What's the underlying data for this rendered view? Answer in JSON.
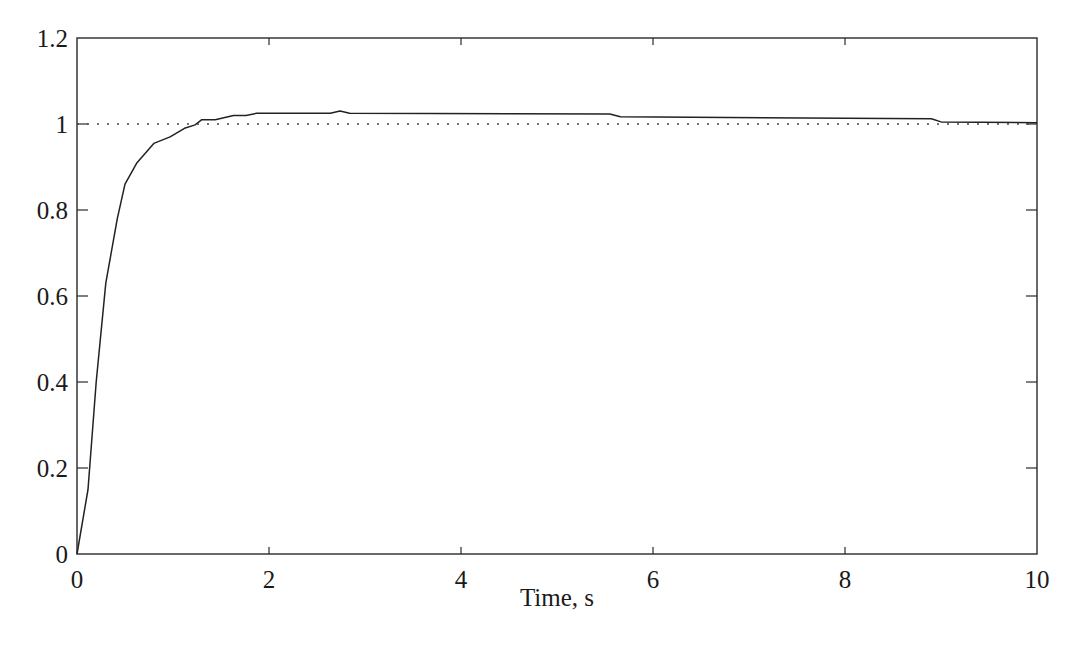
{
  "chart_data": {
    "type": "line",
    "title": "",
    "xlabel": "Time, s",
    "ylabel": "",
    "xlim": [
      0,
      10
    ],
    "ylim": [
      0,
      1.2
    ],
    "grid": false,
    "legend": null,
    "x_ticks": [
      0,
      2,
      4,
      6,
      8,
      10
    ],
    "x_tick_labels": [
      "0",
      "2",
      "4",
      "6",
      "8",
      "10"
    ],
    "y_ticks": [
      0,
      0.2,
      0.4,
      0.6,
      0.8,
      1,
      1.2
    ],
    "y_tick_labels": [
      "0",
      "0.2",
      "0.4",
      "0.6",
      "0.8",
      "1",
      "1.2"
    ],
    "series": [
      {
        "name": "response",
        "style": "solid",
        "color": "#222222",
        "x": [
          0,
          0.115,
          0.2,
          0.3,
          0.42,
          0.5,
          0.625,
          0.8,
          0.97,
          1.12,
          1.23,
          1.3,
          1.44,
          1.63,
          1.76,
          1.87,
          2.64,
          2.74,
          2.84,
          5.55,
          5.66,
          8.9,
          9.0,
          10
        ],
        "values": [
          0,
          0.15,
          0.4,
          0.63,
          0.78,
          0.86,
          0.91,
          0.955,
          0.97,
          0.99,
          0.998,
          1.01,
          1.01,
          1.02,
          1.02,
          1.025,
          1.025,
          1.03,
          1.025,
          1.023,
          1.017,
          1.012,
          1.005,
          1.003
        ]
      },
      {
        "name": "reference",
        "style": "dotted",
        "color": "#444444",
        "x": [
          0,
          10
        ],
        "values": [
          1,
          1
        ]
      }
    ]
  },
  "colors": {
    "axis": "#2a2a2a",
    "background": "#ffffff"
  }
}
